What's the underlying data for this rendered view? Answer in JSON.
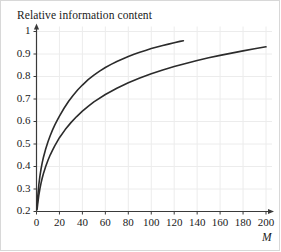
{
  "chart_data": {
    "type": "line",
    "title": "Relative information content",
    "xlabel": "M",
    "ylabel": "",
    "xlim": [
      0,
      200
    ],
    "ylim": [
      0.2,
      1
    ],
    "grid": true,
    "legend": null,
    "xticks": [
      0,
      20,
      40,
      60,
      80,
      100,
      120,
      140,
      160,
      180,
      200
    ],
    "yticks": [
      0.2,
      0.3,
      0.4,
      0.5,
      0.6,
      0.7,
      0.8,
      0.9,
      1
    ],
    "xtick_labels": [
      "0",
      "20",
      "40",
      "60",
      "80",
      "100",
      "120",
      "140",
      "160",
      "180",
      "200"
    ],
    "ytick_labels": [
      "0.2",
      "0.3",
      "0.4",
      "0.5",
      "0.6",
      "0.7",
      "0.8",
      "0.9",
      "1"
    ],
    "series": [
      {
        "name": "upper-curve",
        "color": "#2b2b2b",
        "x": [
          0.5,
          1,
          2,
          3,
          4,
          5,
          6,
          8,
          10,
          12,
          14,
          16,
          18,
          20,
          24,
          28,
          32,
          36,
          40,
          45,
          50,
          55,
          60,
          65,
          70,
          75,
          80,
          85,
          90,
          95,
          100,
          105,
          110,
          115,
          120,
          125,
          128
        ],
        "y": [
          0.225,
          0.262,
          0.318,
          0.358,
          0.39,
          0.417,
          0.44,
          0.478,
          0.51,
          0.538,
          0.563,
          0.585,
          0.605,
          0.624,
          0.659,
          0.69,
          0.717,
          0.741,
          0.762,
          0.786,
          0.806,
          0.824,
          0.84,
          0.854,
          0.867,
          0.878,
          0.889,
          0.899,
          0.908,
          0.916,
          0.924,
          0.931,
          0.938,
          0.944,
          0.95,
          0.956,
          0.959
        ]
      },
      {
        "name": "lower-curve",
        "color": "#2b2b2b",
        "x": [
          0.5,
          1,
          2,
          3,
          4,
          5,
          6,
          8,
          10,
          12,
          14,
          16,
          18,
          20,
          25,
          30,
          35,
          40,
          45,
          50,
          60,
          70,
          80,
          90,
          100,
          110,
          120,
          130,
          140,
          150,
          160,
          170,
          180,
          190,
          200
        ],
        "y": [
          0.208,
          0.232,
          0.272,
          0.302,
          0.327,
          0.349,
          0.368,
          0.4,
          0.428,
          0.452,
          0.473,
          0.493,
          0.511,
          0.528,
          0.564,
          0.595,
          0.622,
          0.646,
          0.667,
          0.687,
          0.72,
          0.748,
          0.772,
          0.793,
          0.812,
          0.829,
          0.844,
          0.858,
          0.871,
          0.883,
          0.894,
          0.904,
          0.914,
          0.923,
          0.932
        ]
      }
    ]
  },
  "figure": {
    "background_color": "#ffffff",
    "grid_color": "#ececec",
    "axis_color": "#3a3a3a",
    "text_color": "#1a1a1a",
    "curve_color": "#2b2b2b"
  }
}
